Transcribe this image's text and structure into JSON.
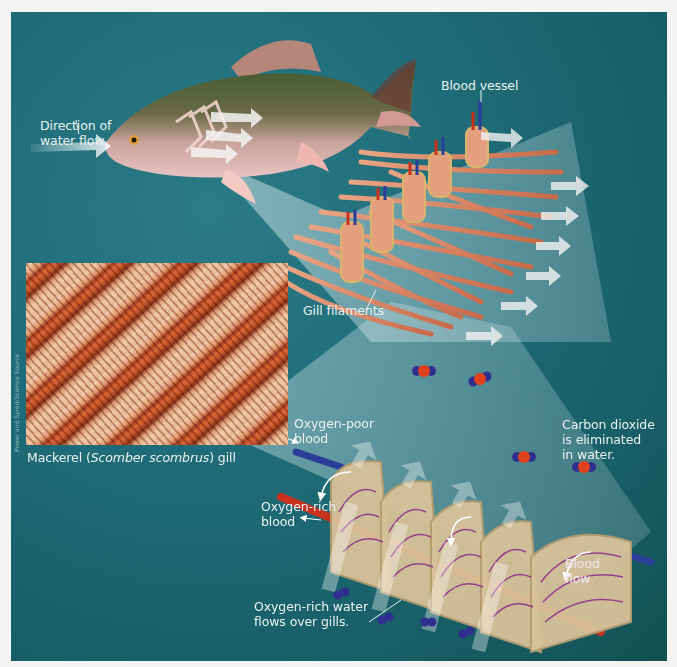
{
  "figure": {
    "labels": {
      "water_flow": [
        "Direction of",
        "water flow"
      ],
      "blood_vessel": "Blood vessel",
      "gill_filaments": "Gill filaments",
      "photo_caption_prefix": "Mackerel (",
      "photo_caption_italic": "Scomber scombrus",
      "photo_caption_suffix": ") gill",
      "photo_credit": "Power and Syred/Science Source",
      "oxygen_poor": [
        "Oxygen-poor",
        "blood"
      ],
      "oxygen_rich": [
        "Oxygen-rich",
        "blood"
      ],
      "co2": [
        "Carbon dioxide",
        "is eliminated",
        "in water."
      ],
      "blood_flow": [
        "Blood",
        "flow"
      ],
      "water_over_gills": [
        "Oxygen-rich water",
        "flows over gills."
      ]
    },
    "colors": {
      "background": "#1f6c78",
      "margin": "#f4f5f3",
      "filament": "#e0896a",
      "oxygen_poor_vessel": "#2a3d9a",
      "oxygen_rich_vessel": "#c8311c",
      "label_text": "#e8f1f1",
      "co2_carbon": "#e0401c",
      "oxygen_atom": "#2f2f8f"
    }
  }
}
